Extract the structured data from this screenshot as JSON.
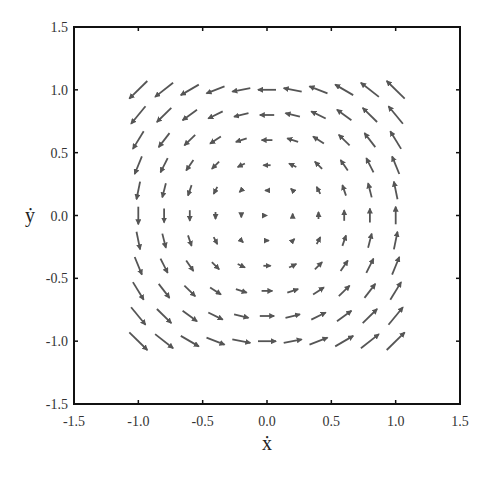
{
  "chart_data": {
    "type": "quiver",
    "title": "",
    "xlabel": "ẋ",
    "ylabel": "ẏ",
    "xlim": [
      -1.5,
      1.5
    ],
    "ylim": [
      -1.5,
      1.5
    ],
    "xticks": [
      "-1.5",
      "-1.0",
      "-0.5",
      "0.0",
      "0.5",
      "1.0",
      "1.5"
    ],
    "yticks": [
      "1.5",
      "1.0",
      "0.5",
      "0.0",
      "-0.5",
      "-1.0",
      "-1.5"
    ],
    "grid": false,
    "legend": null,
    "field": {
      "description": "Counter-clockwise rotational vector field; arrows on a grid of 0.2 spacing spanning roughly -1.0 to 1.0 in both axes, arrow length proportional to distance from origin",
      "u": "-y",
      "v": "x",
      "grid_min": -1.0,
      "grid_max": 1.0,
      "grid_step": 0.2,
      "scale": 0.14
    },
    "arrow_color": "#555555",
    "frame_color": "#111111"
  }
}
